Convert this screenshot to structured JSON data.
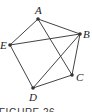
{
  "figure": {
    "caption": "FIGURE 26",
    "vertices": [
      {
        "id": "A",
        "label": "A",
        "x": 38,
        "y": 19,
        "lx": 35,
        "ly": 14
      },
      {
        "id": "B",
        "label": "B",
        "x": 80,
        "y": 34,
        "lx": 83,
        "ly": 38
      },
      {
        "id": "C",
        "label": "C",
        "x": 72,
        "y": 75,
        "lx": 76,
        "ly": 81
      },
      {
        "id": "D",
        "label": "D",
        "x": 33,
        "y": 88,
        "lx": 29,
        "ly": 101
      },
      {
        "id": "E",
        "label": "E",
        "x": 10,
        "y": 45,
        "lx": 0,
        "ly": 49
      }
    ],
    "edges": [
      [
        "A",
        "B"
      ],
      [
        "A",
        "E"
      ],
      [
        "A",
        "C"
      ],
      [
        "B",
        "E"
      ],
      [
        "B",
        "C"
      ],
      [
        "B",
        "D"
      ],
      [
        "E",
        "D"
      ],
      [
        "D",
        "C"
      ]
    ]
  }
}
